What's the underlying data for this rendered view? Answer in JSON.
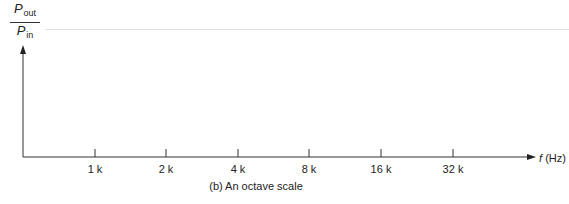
{
  "diagram": {
    "y_axis_label": {
      "numerator": "P",
      "numerator_sub": "out",
      "denominator": "P",
      "denominator_sub": "in"
    },
    "x_axis_label": {
      "symbol": "f",
      "unit": "(Hz)"
    },
    "ticks": [
      {
        "label": "1 k",
        "x": 95
      },
      {
        "label": "2 k",
        "x": 166
      },
      {
        "label": "4 k",
        "x": 238
      },
      {
        "label": "8 k",
        "x": 309
      },
      {
        "label": "16 k",
        "x": 381
      },
      {
        "label": "32 k",
        "x": 453
      }
    ],
    "caption": "(b) An octave scale",
    "colors": {
      "axis": "#333333",
      "header_rule": "#e2e2e2"
    }
  }
}
